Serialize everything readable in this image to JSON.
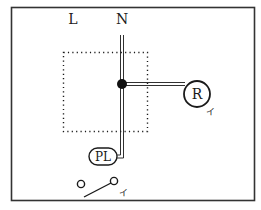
{
  "diagram": {
    "type": "electrical-wiring-diagram",
    "labels": {
      "line": "L",
      "neutral": "N",
      "receptacle": "R",
      "pilot_lamp": "PL",
      "receptacle_mark": "イ",
      "switch_mark": "イ"
    },
    "elements": [
      {
        "id": "border",
        "kind": "rectangle-frame"
      },
      {
        "id": "junction-box",
        "kind": "dotted-rectangle"
      },
      {
        "id": "junction-dot",
        "kind": "connection-point"
      },
      {
        "id": "neutral-wire",
        "kind": "double-line"
      },
      {
        "id": "receptacle",
        "kind": "circle-symbol",
        "label": "R"
      },
      {
        "id": "pilot-lamp",
        "kind": "oval-symbol",
        "label": "PL"
      },
      {
        "id": "switch",
        "kind": "switch-symbol"
      }
    ],
    "colors": {
      "stroke": "#1a1a1a",
      "background": "#ffffff",
      "frame": "#333333"
    }
  }
}
